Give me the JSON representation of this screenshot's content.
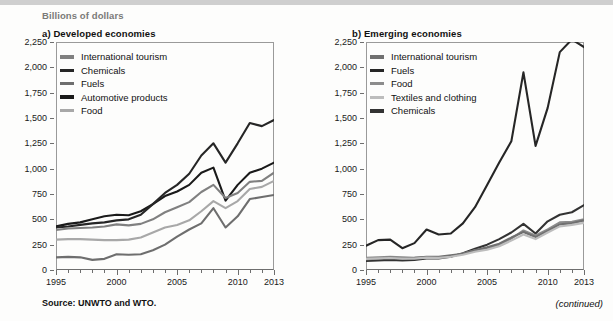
{
  "units_label": "Billions of dollars",
  "source_note": "Source:  UNWTO and WTO.",
  "continued_note": "(continued)",
  "colors": {
    "tourism": "#808080",
    "chemicals_a": "#262626",
    "fuels_a": "#6e6e6e",
    "automotive": "#1a1a1a",
    "food_a": "#a8a8a8",
    "tourism_b": "#707070",
    "fuels_b": "#262626",
    "food_b": "#8c8c8c",
    "textiles": "#bdbdbd",
    "chemicals_b": "#333333",
    "axis": "#6e6e6e",
    "frame": "#9a9a9a"
  },
  "panel_a": {
    "title": "a) Developed economies",
    "legend": [
      {
        "label": "International tourism",
        "color": "#808080",
        "weight": 4
      },
      {
        "label": "Chemicals",
        "color": "#262626",
        "weight": 3
      },
      {
        "label": "Fuels",
        "color": "#6e6e6e",
        "weight": 3
      },
      {
        "label": "Automotive products",
        "color": "#1a1a1a",
        "weight": 4
      },
      {
        "label": "Food",
        "color": "#a8a8a8",
        "weight": 3
      }
    ]
  },
  "panel_b": {
    "title": "b) Emerging economies",
    "legend": [
      {
        "label": "International tourism",
        "color": "#707070",
        "weight": 4
      },
      {
        "label": "Fuels",
        "color": "#262626",
        "weight": 3
      },
      {
        "label": "Food",
        "color": "#8c8c8c",
        "weight": 3
      },
      {
        "label": "Textiles and clothing",
        "color": "#bdbdbd",
        "weight": 3
      },
      {
        "label": "Chemicals",
        "color": "#333333",
        "weight": 4
      }
    ]
  },
  "chart_data": [
    {
      "id": "developed-economies",
      "type": "line",
      "title": "a) Developed economies",
      "xlabel": "",
      "ylabel": "Billions of dollars",
      "ylim": [
        0,
        2250
      ],
      "yticks": [
        0,
        250,
        500,
        750,
        1000,
        1250,
        1500,
        1750,
        2000,
        2250
      ],
      "ytick_labels": [
        "0",
        "250",
        "500",
        "750",
        "1,000",
        "1,250",
        "1,500",
        "1,750",
        "2,000",
        "2,250"
      ],
      "xlim": [
        1995,
        2013
      ],
      "xticks": [
        1995,
        2000,
        2005,
        2010,
        2013
      ],
      "xtick_labels": [
        "1995",
        "2000",
        "2005",
        "2010",
        "2013"
      ],
      "x": [
        1995,
        1996,
        1997,
        1998,
        1999,
        2000,
        2001,
        2002,
        2003,
        2004,
        2005,
        2006,
        2007,
        2008,
        2009,
        2010,
        2011,
        2012,
        2013
      ],
      "grid": false,
      "legend_position": "top-left",
      "series": [
        {
          "name": "Automotive products",
          "color": "#1a1a1a",
          "values": [
            430,
            455,
            470,
            500,
            530,
            545,
            540,
            580,
            650,
            730,
            775,
            840,
            960,
            1010,
            685,
            840,
            960,
            1000,
            1060
          ]
        },
        {
          "name": "Chemicals",
          "color": "#262626",
          "values": [
            420,
            430,
            445,
            460,
            470,
            490,
            500,
            545,
            650,
            760,
            840,
            950,
            1130,
            1250,
            1060,
            1250,
            1450,
            1420,
            1480
          ]
        },
        {
          "name": "International tourism",
          "color": "#808080",
          "values": [
            395,
            410,
            415,
            420,
            430,
            450,
            440,
            455,
            500,
            570,
            620,
            670,
            770,
            840,
            710,
            760,
            870,
            880,
            960
          ]
        },
        {
          "name": "Food",
          "color": "#a8a8a8",
          "values": [
            300,
            305,
            305,
            300,
            295,
            295,
            300,
            320,
            370,
            420,
            445,
            490,
            580,
            680,
            610,
            680,
            800,
            820,
            880
          ]
        },
        {
          "name": "Fuels",
          "color": "#6e6e6e",
          "values": [
            125,
            130,
            125,
            100,
            110,
            155,
            150,
            155,
            195,
            250,
            330,
            400,
            460,
            610,
            420,
            530,
            700,
            720,
            740
          ]
        }
      ],
      "annotations": [
        "All five series rise from 1995 to a 2008 peak, fall sharply in 2009, then recover through 2013.",
        "Chemicals is the highest series after 2007, reaching about 1,550 at its 2011 high and about 1,550 in 2013."
      ]
    },
    {
      "id": "emerging-economies",
      "type": "line",
      "title": "b) Emerging economies",
      "xlabel": "",
      "ylabel": "Billions of dollars",
      "ylim": [
        0,
        2250
      ],
      "yticks": [
        0,
        250,
        500,
        750,
        1000,
        1250,
        1500,
        1750,
        2000,
        2250
      ],
      "ytick_labels": [
        "0",
        "250",
        "500",
        "750",
        "1,000",
        "1,250",
        "1,500",
        "1,750",
        "2,000",
        "2,250"
      ],
      "xlim": [
        1995,
        2013
      ],
      "xticks": [
        1995,
        2000,
        2005,
        2010,
        2013
      ],
      "xtick_labels": [
        "1995",
        "2000",
        "2005",
        "2010",
        "2013"
      ],
      "x": [
        1995,
        1996,
        1997,
        1998,
        1999,
        2000,
        2001,
        2002,
        2003,
        2004,
        2005,
        2006,
        2007,
        2008,
        2009,
        2010,
        2011,
        2012,
        2013
      ],
      "grid": false,
      "legend_position": "top-left",
      "series": [
        {
          "name": "Fuels",
          "color": "#262626",
          "values": [
            240,
            295,
            300,
            215,
            265,
            400,
            350,
            360,
            460,
            620,
            840,
            1060,
            1270,
            1950,
            1225,
            1600,
            2150,
            2275,
            2200
          ]
        },
        {
          "name": "Chemicals",
          "color": "#333333",
          "values": [
            90,
            95,
            100,
            95,
            100,
            115,
            115,
            130,
            165,
            210,
            250,
            305,
            370,
            455,
            360,
            480,
            545,
            570,
            640
          ]
        },
        {
          "name": "Food",
          "color": "#8c8c8c",
          "values": [
            120,
            125,
            130,
            125,
            120,
            125,
            125,
            135,
            160,
            195,
            215,
            250,
            310,
            390,
            340,
            400,
            470,
            475,
            500
          ]
        },
        {
          "name": "International tourism",
          "color": "#707070",
          "values": [
            105,
            115,
            120,
            115,
            120,
            130,
            130,
            145,
            160,
            195,
            225,
            260,
            320,
            375,
            325,
            385,
            450,
            460,
            490
          ]
        },
        {
          "name": "Textiles and clothing",
          "color": "#bdbdbd",
          "values": [
            110,
            115,
            118,
            112,
            112,
            122,
            120,
            130,
            150,
            180,
            200,
            235,
            290,
            350,
            305,
            370,
            430,
            445,
            465
          ]
        }
      ],
      "annotations": [
        "Fuels dominates: it climbs steeply from about 240 in 1995 to a 1,950 spike in 2008, collapses to about 1,225 in 2009, then peaks near 2,275 in 2012.",
        "The other four series stay bunched together below 650 for the whole period."
      ]
    }
  ]
}
